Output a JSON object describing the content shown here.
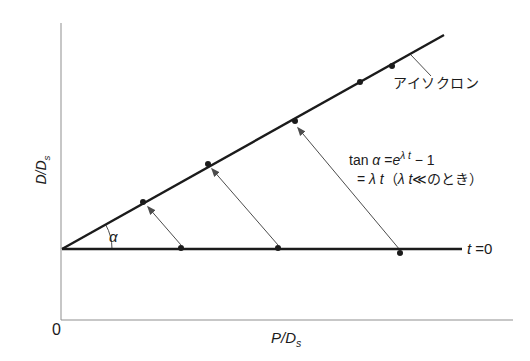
{
  "figure": {
    "width_px": 530,
    "height_px": 361,
    "colors": {
      "background": "#ffffff",
      "line": "#1b1b1b",
      "axis": "#8f8f8f",
      "arrow": "#4d4d4d",
      "text": "#1b1b1b"
    }
  },
  "labels": {
    "origin": "0",
    "x_axis_base": "P/D",
    "x_axis_sub": "s",
    "y_axis_base": "D/D",
    "y_axis_sub": "s",
    "isochron": "アイソクロン",
    "t_zero_var": "t",
    "t_zero_rest": " =0",
    "alpha": "α",
    "formula": {
      "line1_tan": "tan ",
      "line1_alpha": "α",
      "line1_eq": " =",
      "line1_e": "e",
      "line1_sup": "λ t",
      "line1_tail": " − 1",
      "line2_eq": "= ",
      "line2_var1": "λ t",
      "line2_open": "（",
      "line2_var2": "λ t",
      "line2_close": "≪のとき）"
    }
  },
  "chart_data": {
    "type": "line",
    "title": "",
    "xlabel": "P/Ds",
    "ylabel": "D/Ds",
    "x_axis_px": {
      "y": 320,
      "x1": 61,
      "x2": 513
    },
    "y_axis_px": {
      "x": 61,
      "y1": 23,
      "y2": 320
    },
    "lines": [
      {
        "name": "isochron",
        "label": "アイソクロン",
        "x1": 62,
        "y1": 249,
        "x2": 444,
        "y2": 35,
        "stroke_width": 2.4,
        "points_px": [
          [
            143,
            202
          ],
          [
            208,
            164
          ],
          [
            295,
            121
          ],
          [
            360,
            82
          ],
          [
            392,
            66
          ]
        ]
      },
      {
        "name": "t-zero",
        "label": "t =0",
        "x1": 62,
        "y1": 249,
        "x2": 462,
        "y2": 249,
        "stroke_width": 2.6,
        "points_px": [
          [
            181,
            248
          ],
          [
            278,
            248
          ],
          [
            400,
            253
          ]
        ]
      }
    ],
    "growth_arrows": [
      {
        "x1": 181,
        "y1": 245,
        "x2": 148,
        "y2": 207
      },
      {
        "x1": 278,
        "y1": 245,
        "x2": 212,
        "y2": 169
      },
      {
        "x1": 400,
        "y1": 250,
        "x2": 298,
        "y2": 128
      }
    ],
    "isochron_label_leader": {
      "x1": 431,
      "y1": 76,
      "x2": 411,
      "y2": 55
    },
    "angle_arc": {
      "cx": 62,
      "cy": 249,
      "r": 50,
      "start_deg": 0,
      "end_deg": 29.3,
      "label": "α"
    },
    "point_radius": 3
  }
}
